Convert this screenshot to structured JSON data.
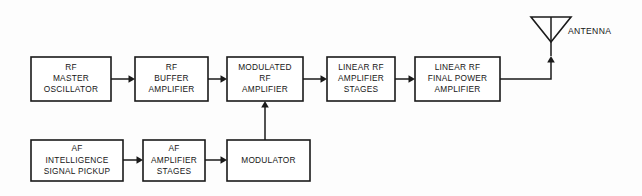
{
  "diagram": {
    "background_color": "#fdfdfd",
    "line_color": "#1a1a1a",
    "text_color": "#161616",
    "blocks": [
      {
        "id": "rf-master-oscillator",
        "lines": [
          "RF",
          "MASTER",
          "OSCILLATOR"
        ],
        "x": 31,
        "y": 57,
        "w": 80,
        "h": 44
      },
      {
        "id": "rf-buffer-amplifier",
        "lines": [
          "RF",
          "BUFFER",
          "AMPLIFIER"
        ],
        "x": 135,
        "y": 57,
        "w": 73,
        "h": 44
      },
      {
        "id": "modulated-rf-amplifier",
        "lines": [
          "MODULATED",
          "RF",
          "AMPLIFIER"
        ],
        "x": 227,
        "y": 57,
        "w": 76,
        "h": 44
      },
      {
        "id": "linear-rf-amplifier-stages",
        "lines": [
          "LINEAR RF",
          "AMPLIFIER",
          "STAGES"
        ],
        "x": 327,
        "y": 57,
        "w": 68,
        "h": 44
      },
      {
        "id": "linear-rf-final-power-amplifier",
        "lines": [
          "LINEAR RF",
          "FINAL POWER",
          "AMPLIFIER"
        ],
        "x": 415,
        "y": 57,
        "w": 85,
        "h": 44
      },
      {
        "id": "af-intelligence-signal-pickup",
        "lines": [
          "AF",
          "INTELLIGENCE",
          "SIGNAL PICKUP"
        ],
        "x": 31,
        "y": 140,
        "w": 92,
        "h": 41
      },
      {
        "id": "af-amplifier-stages",
        "lines": [
          "AF",
          "AMPLIFIER",
          "STAGES"
        ],
        "x": 143,
        "y": 140,
        "w": 62,
        "h": 41
      },
      {
        "id": "modulator",
        "lines": [
          "MODULATOR"
        ],
        "x": 227,
        "y": 140,
        "w": 83,
        "h": 41
      }
    ],
    "antenna": {
      "id": "antenna",
      "label": "ANTENNA",
      "label_x": 568,
      "label_y": 32,
      "triangle_left_x": 531,
      "triangle_right_x": 571,
      "triangle_top_y": 17,
      "triangle_apex_x": 551,
      "triangle_apex_y": 42,
      "mast_bottom_y": 56
    },
    "connections": [
      {
        "id": "osc-to-buffer",
        "type": "arrow-right",
        "x1": 111,
        "y1": 79,
        "x2": 135,
        "y2": 79
      },
      {
        "id": "buffer-to-modulated",
        "type": "arrow-right",
        "x1": 208,
        "y1": 79,
        "x2": 227,
        "y2": 79
      },
      {
        "id": "modulated-to-linear",
        "type": "arrow-right",
        "x1": 303,
        "y1": 79,
        "x2": 327,
        "y2": 79
      },
      {
        "id": "linear-to-final",
        "type": "arrow-right",
        "x1": 395,
        "y1": 79,
        "x2": 415,
        "y2": 79
      },
      {
        "id": "pickup-to-af-amp",
        "type": "arrow-right",
        "x1": 123,
        "y1": 160,
        "x2": 143,
        "y2": 160
      },
      {
        "id": "af-amp-to-modulator",
        "type": "arrow-right",
        "x1": 205,
        "y1": 160,
        "x2": 227,
        "y2": 160
      },
      {
        "id": "modulator-to-modulated",
        "type": "arrow-up",
        "x1": 265,
        "y1": 140,
        "x2": 265,
        "y2": 101
      },
      {
        "id": "final-to-antenna",
        "type": "elbow-up",
        "x1": 500,
        "y1": 79,
        "corner_x": 551,
        "x2": 551,
        "y2": 56
      }
    ]
  }
}
